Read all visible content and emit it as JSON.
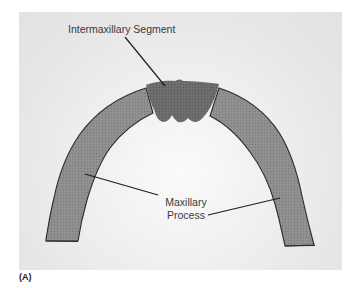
{
  "figure": {
    "panel_letter": "(A)",
    "labels": {
      "intermaxillary": "Intermaxillary Segment",
      "maxillary_line1": "Maxillary",
      "maxillary_line2": "Process"
    },
    "colors": {
      "background": "#e6e6e6",
      "maxillary_fill": "#8c8c8c",
      "intermaxillary_fill": "#6a6a6a",
      "outline": "#2a2a2a",
      "leader_line": "#1e1e1e",
      "label_text": "#3a3a3a"
    }
  }
}
